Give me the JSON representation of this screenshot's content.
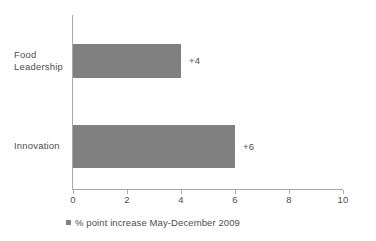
{
  "chart_data": {
    "type": "bar",
    "orientation": "horizontal",
    "title": "",
    "subtitle": "",
    "xlabel": "",
    "ylabel": "",
    "categories": [
      "Food Leadership",
      "Innovation"
    ],
    "category_lines": [
      [
        "Food",
        "Leadership"
      ],
      [
        "Innovation"
      ]
    ],
    "values": [
      4,
      6
    ],
    "data_labels": [
      "+4",
      "+6"
    ],
    "xlim": [
      0,
      10
    ],
    "xticks": [
      0,
      2,
      4,
      6,
      8,
      10
    ],
    "xtick_labels": [
      "0",
      "2",
      "4",
      "6",
      "8",
      "10"
    ],
    "grid": false,
    "legend": {
      "position": "bottom-left",
      "entries": [
        {
          "label": "% point increase May-December 2009",
          "color": "#808080"
        }
      ]
    },
    "series": [
      {
        "name": "% point increase May-December 2009",
        "color": "#808080",
        "values": [
          4,
          6
        ]
      }
    ]
  },
  "colors": {
    "bar": "#808080",
    "axis": "#a9a9a9",
    "text": "#4d4d4d",
    "background": "#ffffff"
  }
}
